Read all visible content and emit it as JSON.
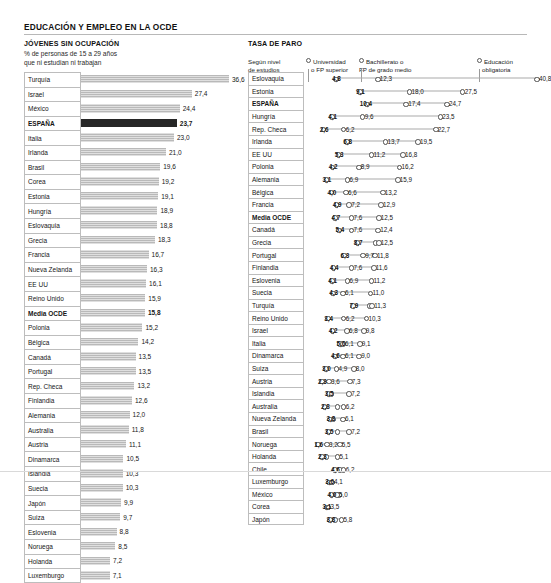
{
  "header": {
    "title": "EDUCACIÓN Y EMPLEO EN LA OCDE"
  },
  "left_panel": {
    "title": "JÓVENES SIN OCUPACIÓN",
    "subtitle_line1": "% de personas de 15 a 29 años",
    "subtitle_line2": "que ni estudian ni trabajan"
  },
  "right_panel": {
    "title": "TASA DE PARO",
    "subtitle_line1": "Según nivel",
    "subtitle_line2": "de estudios",
    "legend": [
      {
        "label_line1": "Universidad",
        "label_line2": "o FP superior"
      },
      {
        "label_line1": "Bachillerato o",
        "label_line2": "FP de grado medio"
      },
      {
        "label_line1": "Educación",
        "label_line2": "obligatoria"
      }
    ]
  },
  "chart_data": [
    {
      "type": "bar",
      "title": "JÓVENES SIN OCUPACIÓN",
      "subtitle": "% de personas de 15 a 29 años que ni estudian ni trabajan",
      "xlabel": "",
      "ylabel": "",
      "xlim": [
        0,
        36.6
      ],
      "grid": false,
      "highlight": [
        "ESPAÑA",
        "Media OCDE"
      ],
      "categories": [
        "Turquía",
        "Israel",
        "México",
        "ESPAÑA",
        "Italia",
        "Irlanda",
        "Brasil",
        "Corea",
        "Estonia",
        "Hungría",
        "Eslovaquia",
        "Grecia",
        "Francia",
        "Nueva Zelanda",
        "EE UU",
        "Reino Unido",
        "Media OCDE",
        "Polonia",
        "Bélgica",
        "Canadá",
        "Portugal",
        "Rep. Checa",
        "Finlandia",
        "Alemania",
        "Australia",
        "Austria",
        "Dinamarca",
        "Islandia",
        "Suecia",
        "Japón",
        "Suiza",
        "Eslovenia",
        "Noruega",
        "Holanda",
        "Luxemburgo"
      ],
      "values": [
        36.6,
        27.4,
        24.4,
        23.7,
        23.0,
        21.0,
        19.6,
        19.2,
        19.1,
        18.9,
        18.8,
        18.3,
        16.7,
        16.3,
        16.1,
        15.9,
        15.8,
        15.2,
        14.2,
        13.5,
        13.5,
        13.2,
        12.6,
        12.0,
        11.8,
        11.1,
        10.5,
        10.3,
        10.3,
        9.9,
        9.7,
        8.8,
        8.5,
        7.2,
        7.1
      ],
      "value_labels": [
        "36,6",
        "27,4",
        "24,4",
        "23,7",
        "23,0",
        "21,0",
        "19,6",
        "19,2",
        "19,1",
        "18,9",
        "18,8",
        "18,3",
        "16,7",
        "16,3",
        "16,1",
        "15,9",
        "15,8",
        "15,2",
        "14,2",
        "13,5",
        "13,5",
        "13,2",
        "12,6",
        "12,0",
        "11,8",
        "11,1",
        "10,5",
        "10,3",
        "10,3",
        "9,9",
        "9,7",
        "8,8",
        "8,5",
        "7,2",
        "7,1"
      ]
    },
    {
      "type": "scatter",
      "title": "TASA DE PARO",
      "subtitle": "Según nivel de estudios",
      "xlabel": "",
      "ylabel": "",
      "xlim": [
        0,
        40.8
      ],
      "grid": false,
      "highlight": [
        "ESPAÑA",
        "Media OCDE"
      ],
      "series": [
        {
          "name": "Universidad o FP superior"
        },
        {
          "name": "Bachillerato o FP de grado medio"
        },
        {
          "name": "Educación obligatoria"
        }
      ],
      "categories": [
        "Eslovaquia",
        "Estonia",
        "ESPAÑA",
        "Hungría",
        "Rep. Checa",
        "Irlanda",
        "EE UU",
        "Polonia",
        "Alemania",
        "Bélgica",
        "Francia",
        "Media OCDE",
        "Canadá",
        "Grecia",
        "Portugal",
        "Finlandia",
        "Eslovenia",
        "Suecia",
        "Turquía",
        "Reino Unido",
        "Israel",
        "Italia",
        "Dinamarca",
        "Suiza",
        "Austria",
        "Islandia",
        "Australia",
        "Nueva Zelanda",
        "Brasil",
        "Noruega",
        "Holanda",
        "Chile",
        "Luxemburgo",
        "México",
        "Corea",
        "Japón"
      ],
      "rows": [
        {
          "country": "Eslovaquia",
          "values": [
            4.8,
            12.3,
            40.8
          ],
          "labels": [
            "4,8",
            "12,3",
            "40,8"
          ]
        },
        {
          "country": "Estonia",
          "values": [
            9.1,
            18.0,
            27.5
          ],
          "labels": [
            "9,1",
            "18,0",
            "27,5"
          ]
        },
        {
          "country": "ESPAÑA",
          "values": [
            10.4,
            17.4,
            24.7
          ],
          "labels": [
            "10,4",
            "17,4",
            "24,7"
          ]
        },
        {
          "country": "Hungría",
          "values": [
            4.1,
            9.6,
            23.5
          ],
          "labels": [
            "4,1",
            "9,6",
            "23,5"
          ]
        },
        {
          "country": "Rep. Checa",
          "values": [
            2.6,
            6.2,
            22.7
          ],
          "labels": [
            "2,6",
            "6,2",
            "22,7"
          ]
        },
        {
          "country": "Irlanda",
          "values": [
            6.8,
            13.7,
            19.5
          ],
          "labels": [
            "6,8",
            "13,7",
            "19,5"
          ]
        },
        {
          "country": "EE UU",
          "values": [
            5.3,
            11.2,
            16.8
          ],
          "labels": [
            "5,3",
            "11,2",
            "16,8"
          ]
        },
        {
          "country": "Polonia",
          "values": [
            4.2,
            8.9,
            16.2
          ],
          "labels": [
            "4,2",
            "8,9",
            "16,2"
          ]
        },
        {
          "country": "Alemania",
          "values": [
            3.1,
            6.9,
            15.9
          ],
          "labels": [
            "3,1",
            "6,9",
            "15,9"
          ]
        },
        {
          "country": "Bélgica",
          "values": [
            4.0,
            6.6,
            13.2
          ],
          "labels": [
            "4,0",
            "6,6",
            "13,2"
          ]
        },
        {
          "country": "Francia",
          "values": [
            4.9,
            7.2,
            12.9
          ],
          "labels": [
            "4,9",
            "7,2",
            "12,9"
          ]
        },
        {
          "country": "Media OCDE",
          "values": [
            4.7,
            7.6,
            12.5
          ],
          "labels": [
            "4,7",
            "7,6",
            "12,5"
          ]
        },
        {
          "country": "Canadá",
          "values": [
            5.4,
            7.6,
            12.4
          ],
          "labels": [
            "5,4",
            "7,6",
            "12,4"
          ]
        },
        {
          "country": "Grecia",
          "values": [
            8.7,
            11.9,
            12.5
          ],
          "labels": [
            "8,7",
            "",
            "12,5"
          ]
        },
        {
          "country": "Portugal",
          "values": [
            6.3,
            9.7,
            11.8
          ],
          "labels": [
            "6,3",
            "9,7",
            "11,8"
          ]
        },
        {
          "country": "Finlandia",
          "values": [
            4.4,
            7.6,
            11.6
          ],
          "labels": [
            "4,4",
            "7,6",
            "11,6"
          ]
        },
        {
          "country": "Eslovenia",
          "values": [
            4.1,
            6.9,
            11.2
          ],
          "labels": [
            "4,1",
            "6,9",
            "11,2"
          ]
        },
        {
          "country": "Suecia",
          "values": [
            4.3,
            6.1,
            11.0
          ],
          "labels": [
            "4,3",
            "6,1",
            "11,0"
          ]
        },
        {
          "country": "Turquía",
          "values": [
            7.9,
            10.8,
            11.3
          ],
          "labels": [
            "7,9",
            "",
            "11,3"
          ]
        },
        {
          "country": "Reino Unido",
          "values": [
            3.4,
            6.2,
            10.3
          ],
          "labels": [
            "3,4",
            "6,2",
            "10,3"
          ]
        },
        {
          "country": "Israel",
          "values": [
            4.2,
            6.8,
            9.8
          ],
          "labels": [
            "4,2",
            "6,8",
            "9,8"
          ]
        },
        {
          "country": "Italia",
          "values": [
            5.6,
            6.1,
            9.1
          ],
          "labels": [
            "5,6",
            "6,1",
            "9,1"
          ]
        },
        {
          "country": "Dinamarca",
          "values": [
            4.6,
            6.1,
            9.0
          ],
          "labels": [
            "4,6",
            "6,1",
            "9,0"
          ]
        },
        {
          "country": "Suiza",
          "values": [
            3.0,
            4.9,
            8.0
          ],
          "labels": [
            "3,0",
            "4,9",
            "8,0"
          ]
        },
        {
          "country": "Austria",
          "values": [
            2.3,
            3.6,
            7.3
          ],
          "labels": [
            "2,3",
            "3,6",
            "7,3"
          ]
        },
        {
          "country": "Islandia",
          "values": [
            3.5,
            4.0,
            7.2
          ],
          "labels": [
            "3,5",
            "",
            "7,2"
          ]
        },
        {
          "country": "Australia",
          "values": [
            2.8,
            5.1,
            6.2
          ],
          "labels": [
            "2,8",
            "",
            "6,2"
          ]
        },
        {
          "country": "Nueva Zelanda",
          "values": [
            3.8,
            4.4,
            6.1
          ],
          "labels": [
            "3,8",
            "",
            "6,1"
          ]
        },
        {
          "country": "Brasil",
          "values": [
            3.5,
            5.1,
            7.2
          ],
          "labels": [
            "3,5",
            "",
            "7,2"
          ]
        },
        {
          "country": "Noruega",
          "values": [
            1.6,
            3.2,
            5.5
          ],
          "labels": [
            "1,6",
            "3,2",
            "5,5"
          ]
        },
        {
          "country": "Holanda",
          "values": [
            2.3,
            3.1,
            5.1
          ],
          "labels": [
            "2,3",
            "",
            "5,1"
          ]
        },
        {
          "country": "Chile",
          "values": [
            4.6,
            5.6,
            6.2
          ],
          "labels": [
            "4,6",
            "",
            "6,2"
          ]
        },
        {
          "country": "Luxemburgo",
          "values": [
            3.6,
            4.1,
            4.1
          ],
          "labels": [
            "3,6",
            "",
            "4,1"
          ]
        },
        {
          "country": "México",
          "values": [
            4.0,
            5.4,
            5.0
          ],
          "labels": [
            "4,0",
            "",
            "5,0"
          ]
        },
        {
          "country": "Corea",
          "values": [
            3.1,
            3.5,
            3.5
          ],
          "labels": [
            "3,1",
            "",
            "3,5"
          ]
        },
        {
          "country": "Japón",
          "values": [
            3.8,
            4.6,
            5.8
          ],
          "labels": [
            "3,8",
            "",
            "5,8"
          ]
        }
      ]
    }
  ]
}
